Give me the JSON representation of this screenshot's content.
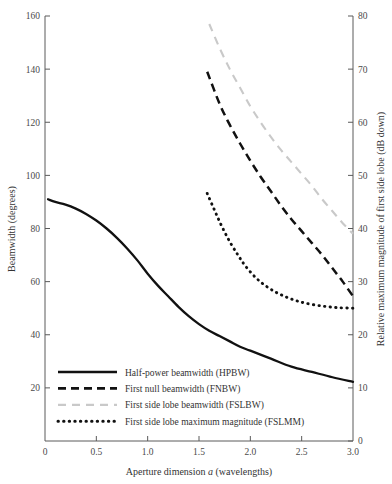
{
  "chart_data": {
    "type": "line",
    "title": "",
    "xlabel": "Aperture dimension a (wavelengths)",
    "ylabel": "Beamwidth (degrees)",
    "ylabel_right": "Relative maximum magnitude of first side lobe (dB down)",
    "xlim": [
      0,
      3.0
    ],
    "ylim": [
      0,
      160
    ],
    "ylim_right": [
      0,
      80
    ],
    "xticks": [
      0,
      0.5,
      1.0,
      1.5,
      2.0,
      2.5,
      3.0
    ],
    "xticklabels": [
      "0",
      "0.5",
      "1.0",
      "1.5",
      "2.0",
      "2.5",
      "3.0"
    ],
    "yticks": [
      20,
      40,
      60,
      80,
      100,
      120,
      140,
      160
    ],
    "yticklabels": [
      "20",
      "40",
      "60",
      "80",
      "100",
      "120",
      "140",
      "160"
    ],
    "yticks_right": [
      0,
      10,
      20,
      30,
      40,
      50,
      60,
      70,
      80
    ],
    "yticklabels_right": [
      "0",
      "10",
      "20",
      "30",
      "40",
      "50",
      "60",
      "70",
      "80"
    ],
    "grid": false,
    "legend_position": "lower-left",
    "series": [
      {
        "name": "Half-power beamwidth (HPBW)",
        "style": "solid",
        "color": "#111111",
        "axis": "left",
        "x": [
          0.03,
          0.1,
          0.2,
          0.3,
          0.4,
          0.5,
          0.6,
          0.7,
          0.8,
          0.9,
          1.0,
          1.1,
          1.2,
          1.3,
          1.4,
          1.5,
          1.6,
          1.7,
          1.8,
          1.9,
          2.0,
          2.2,
          2.4,
          2.6,
          2.8,
          3.0
        ],
        "y": [
          91,
          90,
          89,
          87.5,
          85.5,
          83,
          80,
          76.5,
          72.5,
          68,
          63,
          58.5,
          54.5,
          50.5,
          47,
          44,
          41.5,
          39.5,
          37.5,
          35.5,
          34,
          31,
          28,
          26,
          24,
          22.3
        ]
      },
      {
        "name": "First null beamwidth (FNBW)",
        "style": "dashed",
        "color": "#111111",
        "axis": "left",
        "x": [
          1.58,
          1.7,
          1.8,
          1.9,
          2.0,
          2.1,
          2.2,
          2.3,
          2.4,
          2.5,
          2.6,
          2.7,
          2.8,
          2.9,
          3.0
        ],
        "y": [
          139,
          127,
          119,
          112,
          105.5,
          99.5,
          94,
          88.5,
          83.5,
          79,
          74.5,
          70,
          65,
          60,
          54.5
        ]
      },
      {
        "name": "First side lobe beamwidth (FSLBW)",
        "style": "dashed-light",
        "color": "#c9c9c9",
        "axis": "left",
        "x": [
          1.6,
          1.7,
          1.8,
          1.9,
          2.0,
          2.1,
          2.2,
          2.3,
          2.4,
          2.5,
          2.6,
          2.7,
          2.8,
          2.9,
          3.0
        ],
        "y": [
          157,
          148,
          140,
          133,
          126,
          120,
          114.5,
          109.5,
          105,
          100.5,
          96,
          91,
          86.5,
          82,
          78
        ]
      },
      {
        "name": "First side lobe maximum magnitude (FSLMM)",
        "style": "dotted",
        "color": "#111111",
        "axis": "right",
        "x": [
          1.58,
          1.65,
          1.72,
          1.8,
          1.88,
          1.95,
          2.05,
          2.15,
          2.25,
          2.35,
          2.45,
          2.55,
          2.7,
          2.85,
          3.0
        ],
        "y_right": [
          46.6,
          43.5,
          40.5,
          37.5,
          35,
          33,
          30.8,
          29.2,
          28,
          27.1,
          26.4,
          25.9,
          25.4,
          25.1,
          25.0
        ]
      }
    ],
    "legend": [
      {
        "label": "Half-power beamwidth (HPBW)",
        "style": "solid",
        "color": "#111111"
      },
      {
        "label": "First null beamwidth (FNBW)",
        "style": "dashed",
        "color": "#111111"
      },
      {
        "label": "First side lobe beamwidth (FSLBW)",
        "style": "dashed-light",
        "color": "#c9c9c9"
      },
      {
        "label": "First side lobe maximum magnitude (FSLMM)",
        "style": "dotted",
        "color": "#111111"
      }
    ]
  }
}
